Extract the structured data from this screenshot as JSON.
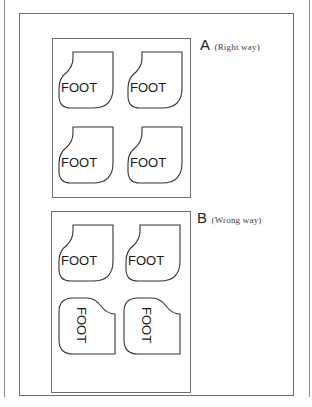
{
  "diagram": {
    "panel_a": {
      "letter": "A",
      "caption": "(Right way)",
      "pieces": [
        {
          "text": "FOOT",
          "orientation": "upright"
        },
        {
          "text": "FOOT",
          "orientation": "upright"
        },
        {
          "text": "FOOT",
          "orientation": "upright"
        },
        {
          "text": "FOOT",
          "orientation": "upright"
        }
      ]
    },
    "panel_b": {
      "letter": "B",
      "caption": "(Wrong way)",
      "pieces": [
        {
          "text": "FOOT",
          "orientation": "upright"
        },
        {
          "text": "FOOT",
          "orientation": "upright"
        },
        {
          "text": "FOOT",
          "orientation": "rotated-90"
        },
        {
          "text": "FOOT",
          "orientation": "rotated-90"
        }
      ]
    }
  }
}
